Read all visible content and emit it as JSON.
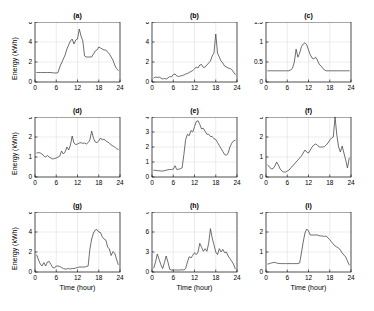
{
  "figure": {
    "layout": "3x3-grid",
    "background_color": "#ffffff",
    "line_color": "#4a4a4a",
    "axis_color": "#000000",
    "grid_color": "#cfcfcf"
  },
  "axis_text": {
    "xlabel": "Time (hour)",
    "ylabel": "Energy (kWh)"
  },
  "chart_data": [
    {
      "type": "line",
      "title": "(a)",
      "xlabel": "",
      "ylabel": "Energy (kWh)",
      "xlim": [
        0,
        24
      ],
      "ylim": [
        0,
        6
      ],
      "xticks": [
        0,
        6,
        12,
        18,
        24
      ],
      "yticks": [
        0,
        2,
        4,
        6
      ],
      "grid": true,
      "x": [
        0.5,
        1,
        1.5,
        2,
        2.5,
        3,
        3.5,
        4,
        4.5,
        5,
        5.5,
        6,
        6.5,
        7,
        7.5,
        8,
        8.5,
        9,
        9.5,
        10,
        10.5,
        11,
        11.5,
        12,
        12.5,
        13,
        13.5,
        14,
        14.5,
        15,
        15.5,
        16,
        16.5,
        17,
        17.5,
        18,
        18.5,
        19,
        19.5,
        20,
        20.5,
        21,
        21.5,
        22,
        22.5,
        23,
        23.5
      ],
      "values": [
        0.95,
        0.95,
        0.95,
        0.95,
        0.95,
        0.95,
        0.95,
        0.95,
        0.95,
        0.92,
        0.9,
        0.9,
        0.95,
        1.5,
        1.9,
        2.3,
        2.7,
        3.3,
        3.7,
        4.1,
        4.3,
        3.8,
        4.2,
        4.3,
        5.3,
        4.6,
        4.1,
        2.6,
        2.5,
        2.5,
        2.5,
        2.5,
        2.8,
        3.1,
        3.2,
        3.5,
        3.4,
        3.3,
        3.2,
        3.2,
        3.0,
        2.8,
        2.5,
        2.2,
        1.7,
        1.35,
        1.15
      ]
    },
    {
      "type": "line",
      "title": "(b)",
      "xlabel": "",
      "ylabel": "",
      "xlim": [
        0,
        24
      ],
      "ylim": [
        0,
        6
      ],
      "xticks": [
        0,
        6,
        12,
        18,
        24
      ],
      "yticks": [
        0,
        2,
        4,
        6
      ],
      "grid": true,
      "x": [
        0.5,
        1,
        1.5,
        2,
        2.5,
        3,
        3.5,
        4,
        4.5,
        5,
        5.5,
        6,
        6.5,
        7,
        7.5,
        8,
        8.5,
        9,
        9.5,
        10,
        10.5,
        11,
        11.5,
        12,
        12.5,
        13,
        13.5,
        14,
        14.5,
        15,
        15.5,
        16,
        16.5,
        17,
        17.5,
        18,
        18.5,
        19,
        19.5,
        20,
        20.5,
        21,
        21.5,
        22,
        22.5,
        23,
        23.5
      ],
      "values": [
        0.4,
        0.5,
        0.45,
        0.5,
        0.4,
        0.3,
        0.35,
        0.3,
        0.4,
        0.55,
        0.5,
        0.75,
        0.8,
        0.6,
        0.55,
        0.6,
        0.65,
        0.7,
        0.8,
        0.85,
        0.95,
        1.05,
        1.15,
        1.3,
        1.5,
        1.4,
        1.7,
        1.75,
        1.45,
        1.5,
        1.7,
        1.9,
        2.1,
        2.6,
        2.9,
        4.8,
        2.9,
        2.5,
        2.1,
        1.9,
        1.6,
        1.5,
        1.4,
        1.35,
        1.25,
        1.0,
        0.75
      ]
    },
    {
      "type": "line",
      "title": "(c)",
      "xlabel": "",
      "ylabel": "",
      "xlim": [
        0,
        24
      ],
      "ylim": [
        0,
        1.5
      ],
      "xticks": [
        0,
        6,
        12,
        18,
        24
      ],
      "yticks": [
        0,
        0.5,
        1,
        1.5
      ],
      "grid": true,
      "x": [
        0.5,
        1,
        1.5,
        2,
        2.5,
        3,
        3.5,
        4,
        4.5,
        5,
        5.5,
        6,
        6.5,
        7,
        7.5,
        8,
        8.5,
        9,
        9.5,
        10,
        10.5,
        11,
        11.5,
        12,
        12.5,
        13,
        13.5,
        14,
        14.5,
        15,
        15.5,
        16,
        16.5,
        17,
        17.5,
        18,
        18.5,
        19,
        19.5,
        20,
        20.5,
        21,
        21.5,
        22,
        22.5,
        23,
        23.5
      ],
      "values": [
        0.28,
        0.28,
        0.28,
        0.28,
        0.28,
        0.28,
        0.28,
        0.28,
        0.28,
        0.28,
        0.28,
        0.28,
        0.28,
        0.3,
        0.35,
        0.5,
        0.82,
        0.62,
        0.72,
        0.88,
        0.95,
        0.98,
        0.93,
        0.8,
        0.68,
        0.6,
        0.58,
        0.62,
        0.55,
        0.45,
        0.4,
        0.35,
        0.3,
        0.28,
        0.28,
        0.28,
        0.28,
        0.28,
        0.28,
        0.28,
        0.28,
        0.28,
        0.28,
        0.28,
        0.28,
        0.28,
        0.28
      ]
    },
    {
      "type": "line",
      "title": "(d)",
      "xlabel": "",
      "ylabel": "Energy (kWh)",
      "xlim": [
        0,
        24
      ],
      "ylim": [
        0,
        3
      ],
      "xticks": [
        0,
        6,
        12,
        18,
        24
      ],
      "yticks": [
        0,
        1,
        2,
        3
      ],
      "grid": true,
      "x": [
        0.5,
        1,
        1.5,
        2,
        2.5,
        3,
        3.5,
        4,
        4.5,
        5,
        5.5,
        6,
        6.5,
        7,
        7.5,
        8,
        8.5,
        9,
        9.5,
        10,
        10.5,
        11,
        11.5,
        12,
        12.5,
        13,
        13.5,
        14,
        14.5,
        15,
        15.5,
        16,
        16.5,
        17,
        17.5,
        18,
        18.5,
        19,
        19.5,
        20,
        20.5,
        21,
        21.5,
        22,
        22.5,
        23,
        23.5
      ],
      "values": [
        1.2,
        1.22,
        1.2,
        1.15,
        1.05,
        1.0,
        1.08,
        1.0,
        0.95,
        0.9,
        0.92,
        0.95,
        1.0,
        1.05,
        1.3,
        1.15,
        1.25,
        1.5,
        1.35,
        1.6,
        2.05,
        1.7,
        1.62,
        1.65,
        1.7,
        1.72,
        1.68,
        1.7,
        1.65,
        1.72,
        1.85,
        2.3,
        1.95,
        1.75,
        1.72,
        1.8,
        1.95,
        1.85,
        1.9,
        1.8,
        1.75,
        1.7,
        1.6,
        1.55,
        1.5,
        1.42,
        1.38
      ]
    },
    {
      "type": "line",
      "title": "(e)",
      "xlabel": "",
      "ylabel": "",
      "xlim": [
        0,
        24
      ],
      "ylim": [
        0,
        4
      ],
      "xticks": [
        0,
        6,
        12,
        18,
        24
      ],
      "yticks": [
        0,
        1,
        2,
        3,
        4
      ],
      "grid": true,
      "x": [
        0.5,
        1,
        1.5,
        2,
        2.5,
        3,
        3.5,
        4,
        4.5,
        5,
        5.5,
        6,
        6.5,
        7,
        7.5,
        8,
        8.5,
        9,
        9.5,
        10,
        10.5,
        11,
        11.5,
        12,
        12.5,
        13,
        13.5,
        14,
        14.5,
        15,
        15.5,
        16,
        16.5,
        17,
        17.5,
        18,
        18.5,
        19,
        19.5,
        20,
        20.5,
        21,
        21.5,
        22,
        22.5,
        23,
        23.5
      ],
      "values": [
        0.45,
        0.45,
        0.42,
        0.42,
        0.4,
        0.4,
        0.42,
        0.45,
        0.48,
        0.5,
        0.5,
        0.52,
        0.75,
        0.5,
        0.52,
        0.55,
        0.6,
        1.5,
        2.5,
        2.85,
        2.75,
        3.1,
        3.0,
        3.35,
        3.7,
        3.75,
        3.5,
        3.2,
        3.25,
        3.05,
        2.85,
        2.85,
        2.7,
        2.7,
        2.55,
        2.5,
        2.3,
        2.1,
        1.9,
        1.7,
        1.5,
        1.45,
        1.6,
        2.0,
        2.25,
        2.4,
        2.45
      ]
    },
    {
      "type": "line",
      "title": "(f)",
      "xlabel": "",
      "ylabel": "",
      "xlim": [
        0,
        24
      ],
      "ylim": [
        0,
        3
      ],
      "xticks": [
        0,
        6,
        12,
        18,
        24
      ],
      "yticks": [
        0,
        1,
        2,
        3
      ],
      "grid": true,
      "x": [
        0.5,
        1,
        1.5,
        2,
        2.5,
        3,
        3.5,
        4,
        4.5,
        5,
        5.5,
        6,
        6.5,
        7,
        7.5,
        8,
        8.5,
        9,
        9.5,
        10,
        10.5,
        11,
        11.5,
        12,
        12.5,
        13,
        13.5,
        14,
        14.5,
        15,
        15.5,
        16,
        16.5,
        17,
        17.5,
        18,
        18.5,
        19,
        19.5,
        20,
        20.5,
        21,
        21.5,
        22,
        22.5,
        23,
        23.5
      ],
      "values": [
        0.6,
        0.5,
        0.4,
        0.42,
        0.55,
        0.75,
        0.6,
        0.4,
        0.3,
        0.25,
        0.25,
        0.3,
        0.35,
        0.45,
        0.55,
        0.65,
        0.75,
        0.85,
        0.95,
        1.05,
        1.2,
        1.35,
        1.25,
        1.2,
        1.35,
        1.5,
        1.6,
        1.65,
        1.6,
        1.5,
        1.5,
        1.5,
        1.52,
        1.6,
        1.7,
        1.85,
        1.95,
        2.0,
        3.0,
        2.1,
        1.5,
        1.25,
        1.55,
        1.2,
        0.85,
        0.45,
        0.95
      ]
    },
    {
      "type": "line",
      "title": "(g)",
      "xlabel": "Time (hour)",
      "ylabel": "Energy (kWh)",
      "xlim": [
        0,
        24
      ],
      "ylim": [
        0,
        6
      ],
      "xticks": [
        0,
        6,
        12,
        18,
        24
      ],
      "yticks": [
        0,
        2,
        4,
        6
      ],
      "grid": true,
      "x": [
        0.5,
        1,
        1.5,
        2,
        2.5,
        3,
        3.5,
        4,
        4.5,
        5,
        5.5,
        6,
        6.5,
        7,
        7.5,
        8,
        8.5,
        9,
        9.5,
        10,
        10.5,
        11,
        11.5,
        12,
        12.5,
        13,
        13.5,
        14,
        14.5,
        15,
        15.5,
        16,
        16.5,
        17,
        17.5,
        18,
        18.5,
        19,
        19.5,
        20,
        20.5,
        21,
        21.5,
        22,
        22.5,
        23,
        23.5
      ],
      "values": [
        1.7,
        1.2,
        0.8,
        0.6,
        0.95,
        0.6,
        1.0,
        1.05,
        0.75,
        0.45,
        0.4,
        0.6,
        0.6,
        0.55,
        0.45,
        0.35,
        0.3,
        0.3,
        0.35,
        0.3,
        0.35,
        0.35,
        0.4,
        0.45,
        0.5,
        0.5,
        0.5,
        0.5,
        0.55,
        0.6,
        2.3,
        3.3,
        3.9,
        4.2,
        4.25,
        4.0,
        3.95,
        3.5,
        3.3,
        3.2,
        2.5,
        2.3,
        1.65,
        2.05,
        1.9,
        1.3,
        0.75
      ]
    },
    {
      "type": "line",
      "title": "(h)",
      "xlabel": "Time (hour)",
      "ylabel": "",
      "xlim": [
        0,
        24
      ],
      "ylim": [
        0,
        9
      ],
      "xticks": [
        0,
        6,
        12,
        18,
        24
      ],
      "yticks": [
        0,
        3,
        6,
        9
      ],
      "grid": true,
      "x": [
        0.5,
        1,
        1.5,
        2,
        2.5,
        3,
        3.5,
        4,
        4.5,
        5,
        5.5,
        6,
        6.5,
        7,
        7.5,
        8,
        8.5,
        9,
        9.5,
        10,
        10.5,
        11,
        11.5,
        12,
        12.5,
        13,
        13.5,
        14,
        14.5,
        15,
        15.5,
        16,
        16.5,
        17,
        17.5,
        18,
        18.5,
        19,
        19.5,
        20,
        20.5,
        21,
        21.5,
        22,
        22.5,
        23,
        23.5
      ],
      "values": [
        0.6,
        1.5,
        2.7,
        1.9,
        1.1,
        0.5,
        1.4,
        2.4,
        1.5,
        0.4,
        0.3,
        0.3,
        0.3,
        0.3,
        0.3,
        0.3,
        0.35,
        0.3,
        0.5,
        1.5,
        2.3,
        2.1,
        2.5,
        2.9,
        2.6,
        3.0,
        4.3,
        3.7,
        3.1,
        3.5,
        3.1,
        4.3,
        6.5,
        5.1,
        4.1,
        3.0,
        2.6,
        3.5,
        3.0,
        3.4,
        2.9,
        3.0,
        2.4,
        2.0,
        1.6,
        1.2,
        0.5
      ]
    },
    {
      "type": "line",
      "title": "(i)",
      "xlabel": "Time (hour)",
      "ylabel": "",
      "xlim": [
        0,
        24
      ],
      "ylim": [
        0,
        3
      ],
      "xticks": [
        0,
        6,
        12,
        18,
        24
      ],
      "yticks": [
        0,
        1,
        2,
        3
      ],
      "grid": true,
      "x": [
        0.5,
        1,
        1.5,
        2,
        2.5,
        3,
        3.5,
        4,
        4.5,
        5,
        5.5,
        6,
        6.5,
        7,
        7.5,
        8,
        8.5,
        9,
        9.5,
        10,
        10.5,
        11,
        11.5,
        12,
        12.5,
        13,
        13.5,
        14,
        14.5,
        15,
        15.5,
        16,
        16.5,
        17,
        17.5,
        18,
        18.5,
        19,
        19.5,
        20,
        20.5,
        21,
        21.5,
        22,
        22.5,
        23,
        23.5
      ],
      "values": [
        0.4,
        0.42,
        0.45,
        0.47,
        0.48,
        0.45,
        0.43,
        0.42,
        0.42,
        0.42,
        0.42,
        0.42,
        0.42,
        0.42,
        0.42,
        0.42,
        0.42,
        0.42,
        0.45,
        0.95,
        1.5,
        1.95,
        2.15,
        2.05,
        1.85,
        1.85,
        1.85,
        1.85,
        1.85,
        1.82,
        1.8,
        1.8,
        1.78,
        1.8,
        1.7,
        1.62,
        1.5,
        1.4,
        1.3,
        1.25,
        1.2,
        1.1,
        0.95,
        0.85,
        0.75,
        0.55,
        0.35
      ]
    }
  ]
}
